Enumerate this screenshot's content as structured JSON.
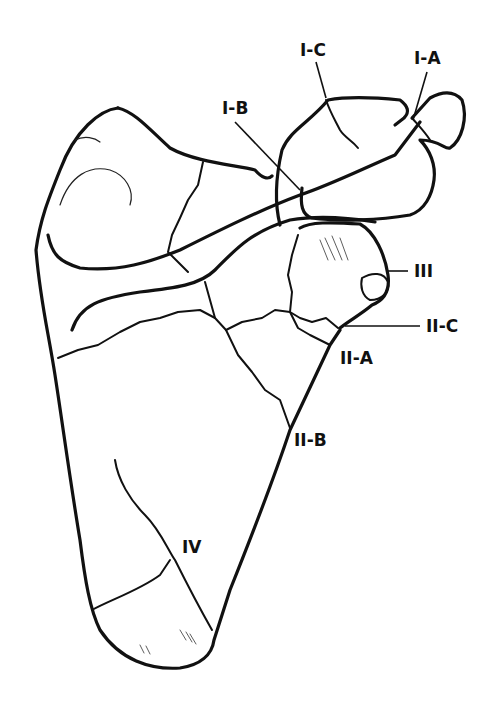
{
  "figure": {
    "labels": {
      "I_A": "I-A",
      "I_B": "I-B",
      "I_C": "I-C",
      "II_A": "II-A",
      "II_B": "II-B",
      "II_C": "II-C",
      "III": "III",
      "IV": "IV"
    },
    "colors": {
      "ink": "#111111",
      "background": "#ffffff"
    }
  }
}
